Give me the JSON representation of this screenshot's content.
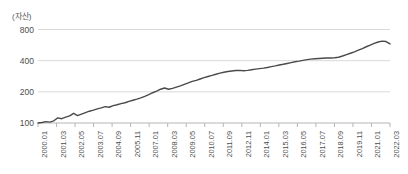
{
  "chart_data": {
    "type": "line",
    "title": "",
    "subtitle": "",
    "xlabel": "",
    "ylabel": "(자산)",
    "yscale": "log",
    "ylim": [
      100,
      900
    ],
    "grid": true,
    "legend": "none",
    "y_ticks": [
      {
        "label": "800",
        "value": 800
      },
      {
        "label": "400",
        "value": 400
      },
      {
        "label": "200",
        "value": 200
      },
      {
        "label": "100",
        "value": 100
      }
    ],
    "x_tick_labels": [
      "2000.01",
      "2001.03",
      "2002.05",
      "2003.07",
      "2004.09",
      "2005.11",
      "2007.01",
      "2008.03",
      "2009.05",
      "2010.07",
      "2011.09",
      "2012.11",
      "2014.01",
      "2015.03",
      "2016.05",
      "2017.07",
      "2018.09",
      "2019.11",
      "2021.01",
      "2022.03"
    ],
    "series": [
      {
        "name": "자산",
        "color": "#4a4a4a",
        "x": [
          "2000.01",
          "2000.04",
          "2000.07",
          "2000.10",
          "2001.01",
          "2001.04",
          "2001.07",
          "2001.10",
          "2002.01",
          "2002.04",
          "2002.07",
          "2002.10",
          "2003.01",
          "2003.04",
          "2003.07",
          "2003.10",
          "2004.01",
          "2004.04",
          "2004.07",
          "2004.10",
          "2005.01",
          "2005.04",
          "2005.07",
          "2005.10",
          "2006.01",
          "2006.04",
          "2006.07",
          "2006.10",
          "2007.01",
          "2007.04",
          "2007.07",
          "2007.10",
          "2008.01",
          "2008.04",
          "2008.07",
          "2008.10",
          "2009.01",
          "2009.04",
          "2009.07",
          "2009.10",
          "2010.01",
          "2010.04",
          "2010.07",
          "2010.10",
          "2011.01",
          "2011.04",
          "2011.07",
          "2011.10",
          "2012.01",
          "2012.04",
          "2012.07",
          "2012.10",
          "2013.01",
          "2013.04",
          "2013.07",
          "2013.10",
          "2014.01",
          "2014.04",
          "2014.07",
          "2014.10",
          "2015.01",
          "2015.04",
          "2015.07",
          "2015.10",
          "2016.01",
          "2016.04",
          "2016.07",
          "2016.10",
          "2017.01",
          "2017.04",
          "2017.07",
          "2017.10",
          "2018.01",
          "2018.04",
          "2018.07",
          "2018.10",
          "2019.01",
          "2019.04",
          "2019.07",
          "2019.10",
          "2020.01",
          "2020.04",
          "2020.07",
          "2020.10",
          "2021.01",
          "2021.04",
          "2021.07",
          "2021.10",
          "2022.01",
          "2022.03"
        ],
        "values": [
          100,
          101,
          103,
          102,
          105,
          112,
          110,
          114,
          117,
          124,
          118,
          122,
          126,
          130,
          133,
          137,
          140,
          144,
          142,
          147,
          150,
          154,
          157,
          162,
          166,
          170,
          175,
          181,
          188,
          196,
          203,
          212,
          218,
          212,
          216,
          222,
          228,
          236,
          244,
          252,
          258,
          266,
          274,
          281,
          288,
          296,
          303,
          309,
          314,
          318,
          321,
          322,
          320,
          322,
          327,
          331,
          335,
          339,
          344,
          350,
          356,
          363,
          369,
          376,
          383,
          390,
          396,
          403,
          409,
          414,
          418,
          420,
          422,
          424,
          425,
          427,
          432,
          444,
          458,
          472,
          487,
          505,
          524,
          545,
          566,
          588,
          606,
          618,
          612,
          580
        ]
      }
    ],
    "annotations": []
  }
}
